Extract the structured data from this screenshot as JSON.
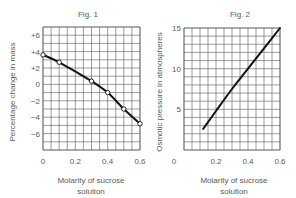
{
  "chart_data": [
    {
      "type": "line",
      "title": "Fig. 1",
      "xlabel": "Molarity of sucrose solution",
      "xlabel_lines": [
        "Molarity of sucrose",
        "solution"
      ],
      "ylabel": "Percentage change in mass",
      "x_ticks": [
        "0",
        "0.2",
        "0.4",
        "0.6"
      ],
      "y_ticks": [
        "+6",
        "+4",
        "+2",
        "0",
        "−2",
        "−4",
        "−6"
      ],
      "xlim": [
        0,
        0.6
      ],
      "ylim": [
        -8,
        7
      ],
      "grid": true,
      "markers": "open-circle",
      "x": [
        0,
        0.1,
        0.3,
        0.4,
        0.5,
        0.6
      ],
      "y": [
        3.6,
        2.7,
        0.4,
        -1.0,
        -3.0,
        -4.8
      ]
    },
    {
      "type": "line",
      "title": "Fig. 2",
      "xlabel": "Molarity of sucrose solution",
      "xlabel_lines": [
        "Molarity of sucrose",
        "solution"
      ],
      "ylabel": "Osmotic pressure in atmospheres",
      "x_ticks": [
        "0",
        "0.2",
        "0.4",
        "0.6"
      ],
      "y_ticks": [
        "15",
        "10",
        "5"
      ],
      "y_zero_label": "0",
      "xlim": [
        0,
        0.6
      ],
      "ylim": [
        0,
        15
      ],
      "grid": true,
      "markers": "none",
      "x": [
        0.12,
        0.2,
        0.3,
        0.4,
        0.5,
        0.6
      ],
      "y": [
        2.6,
        4.8,
        7.5,
        10.0,
        12.5,
        15.0
      ]
    }
  ],
  "colors": {
    "grid": "#5a5a5a",
    "line": "#111111",
    "text": "#5a5a5a",
    "background": "#ffffff"
  }
}
